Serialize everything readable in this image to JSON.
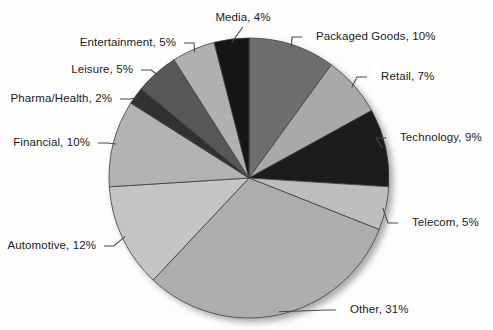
{
  "chart_data": {
    "type": "pie",
    "title": "",
    "subtitle": "",
    "xlabel": "",
    "ylabel": "",
    "legend_position": "none",
    "grid": false,
    "total_percent": 100,
    "start_angle_deg": 0,
    "direction": "clockwise",
    "categories": [
      "Packaged Goods",
      "Retail",
      "Technology",
      "Telecom",
      "Other",
      "Automotive",
      "Financial",
      "Pharma/Health",
      "Leisure",
      "Entertainment",
      "Media"
    ],
    "values": [
      10,
      7,
      9,
      5,
      31,
      12,
      10,
      2,
      5,
      5,
      4
    ],
    "slices": [
      {
        "label": "Packaged Goods",
        "value": 10,
        "label_text": "Packaged Goods, 10%",
        "color": "#6e6e6e",
        "side": "right"
      },
      {
        "label": "Retail",
        "value": 7,
        "label_text": "Retail, 7%",
        "color": "#a9a9a9",
        "side": "right"
      },
      {
        "label": "Technology",
        "value": 9,
        "label_text": "Technology, 9%",
        "color": "#1c1c1c",
        "side": "right"
      },
      {
        "label": "Telecom",
        "value": 5,
        "label_text": "Telecom, 5%",
        "color": "#bdbdbd",
        "side": "right"
      },
      {
        "label": "Other",
        "value": 31,
        "label_text": "Other, 31%",
        "color": "#adadad",
        "side": "right"
      },
      {
        "label": "Automotive",
        "value": 12,
        "label_text": "Automotive, 12%",
        "color": "#c4c4c4",
        "side": "left"
      },
      {
        "label": "Financial",
        "value": 10,
        "label_text": "Financial, 10%",
        "color": "#b2b2b2",
        "side": "left"
      },
      {
        "label": "Pharma/Health",
        "value": 2,
        "label_text": "Pharma/Health, 2%",
        "color": "#333333",
        "side": "left"
      },
      {
        "label": "Leisure",
        "value": 5,
        "label_text": "Leisure, 5%",
        "color": "#595959",
        "side": "left"
      },
      {
        "label": "Entertainment",
        "value": 5,
        "label_text": "Entertainment, 5%",
        "color": "#b0b0b0",
        "side": "left"
      },
      {
        "label": "Media",
        "value": 4,
        "label_text": "Media, 4%",
        "color": "#161616",
        "side": "top"
      }
    ],
    "geometry": {
      "center_x": 249,
      "center_y": 178,
      "radius": 140
    },
    "colors": {
      "background": "#fdfdfd",
      "slice_border": "#3d3d3d",
      "leader_line": "#4a4a4a",
      "label": "#1b1b1b",
      "shadow": "#8c8c8c"
    },
    "label_positions": [
      {
        "label": "Packaged Goods",
        "x": 316,
        "y": 30,
        "align": "left"
      },
      {
        "label": "Retail",
        "x": 381,
        "y": 70,
        "align": "left"
      },
      {
        "label": "Technology",
        "x": 400,
        "y": 131,
        "align": "left"
      },
      {
        "label": "Telecom",
        "x": 412,
        "y": 216,
        "align": "left"
      },
      {
        "label": "Other",
        "x": 350,
        "y": 303,
        "align": "left"
      },
      {
        "label": "Automotive",
        "x": 96,
        "y": 239,
        "align": "right"
      },
      {
        "label": "Financial",
        "x": 90,
        "y": 136,
        "align": "right"
      },
      {
        "label": "Pharma/Health",
        "x": 112,
        "y": 92,
        "align": "right"
      },
      {
        "label": "Leisure",
        "x": 133,
        "y": 63,
        "align": "right"
      },
      {
        "label": "Entertainment",
        "x": 176,
        "y": 36,
        "align": "right"
      },
      {
        "label": "Media",
        "x": 243,
        "y": 11,
        "align": "center"
      }
    ]
  }
}
